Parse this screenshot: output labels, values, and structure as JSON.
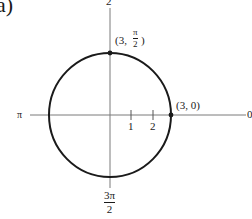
{
  "figure": {
    "part_label": "a)",
    "curve": "circle",
    "center": {
      "x": 110,
      "y": 115
    },
    "radius": 61,
    "colors": {
      "curve": "#1a1a1a",
      "axis": "#7a7a7a",
      "text": "#1a1a1a"
    }
  },
  "axes": {
    "top_label": "2",
    "left_label": "π",
    "right_label": "0",
    "bottom_label": {
      "numerator": "3π",
      "denominator": "2"
    }
  },
  "ticks": [
    {
      "label": "1",
      "x": 131
    },
    {
      "label": "2",
      "x": 153
    }
  ],
  "points": [
    {
      "name": "top",
      "label_prefix": "(3, ",
      "numerator": "π",
      "denominator": "2",
      "label_suffix": ")"
    },
    {
      "name": "right",
      "label": "(3, 0)"
    }
  ]
}
